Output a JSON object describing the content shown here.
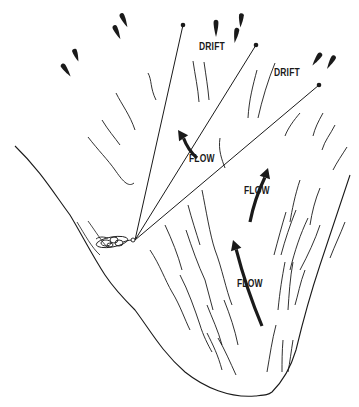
{
  "diagram": {
    "type": "line-drawing",
    "colors": {
      "ink": "#1a1a1a",
      "background": "#ffffff"
    },
    "labels": [
      {
        "id": "drift-1",
        "text": "DRIFT",
        "x": 199,
        "y": 47
      },
      {
        "id": "drift-2",
        "text": "DRIFT",
        "x": 274,
        "y": 73
      },
      {
        "id": "flow-1",
        "text": "FLOW",
        "x": 189,
        "y": 159
      },
      {
        "id": "flow-2",
        "text": "FLOW",
        "x": 244,
        "y": 191
      },
      {
        "id": "flow-3",
        "text": "FLOW",
        "x": 237,
        "y": 284
      }
    ],
    "drift_items": [
      {
        "x": 124,
        "y": 20,
        "angle": 155,
        "len": 16
      },
      {
        "x": 117,
        "y": 32,
        "angle": 155,
        "len": 16
      },
      {
        "x": 76,
        "y": 55,
        "angle": 160,
        "len": 14
      },
      {
        "x": 66,
        "y": 70,
        "angle": 145,
        "len": 16
      },
      {
        "x": 216,
        "y": 28,
        "angle": 180,
        "len": 18
      },
      {
        "x": 241,
        "y": 20,
        "angle": 185,
        "len": 15
      },
      {
        "x": 236,
        "y": 35,
        "angle": 190,
        "len": 16
      },
      {
        "x": 317,
        "y": 59,
        "angle": 215,
        "len": 16
      },
      {
        "x": 331,
        "y": 62,
        "angle": 210,
        "len": 16
      }
    ],
    "lines": [
      {
        "id": "line-1",
        "from": [
          135,
          240
        ],
        "to": [
          183,
          25
        ],
        "end_dot": true
      },
      {
        "id": "line-2",
        "from": [
          135,
          240
        ],
        "to": [
          256,
          45
        ],
        "end_dot": true
      },
      {
        "id": "line-3",
        "from": [
          135,
          240
        ],
        "to": [
          319,
          85
        ],
        "end_dot": true
      }
    ],
    "flow_arrows": [
      {
        "id": "flow-arrow-1",
        "from": [
          197,
          158
        ],
        "to": [
          178,
          130
        ]
      },
      {
        "id": "flow-arrow-2",
        "from": [
          250,
          222
        ],
        "to": [
          268,
          168
        ]
      },
      {
        "id": "flow-arrow-3",
        "from": [
          262,
          326
        ],
        "to": [
          233,
          240
        ]
      }
    ],
    "angler_cluster": {
      "x": 115,
      "y": 242
    }
  }
}
